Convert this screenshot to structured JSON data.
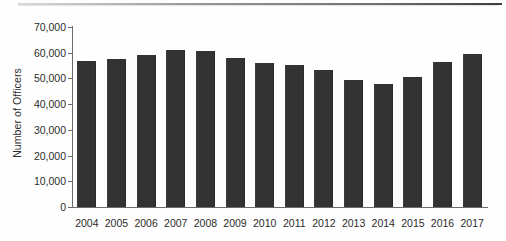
{
  "figure": {
    "background_color": "#fefefe",
    "bar_color": "#333333",
    "axis_color": "#6b6b6b",
    "text_color": "#2b2b2b",
    "top_rule": "horizontal-rule-artifact"
  },
  "axes": {
    "y_title": "Number of Officers",
    "y_tick_labels": [
      "70,000",
      "60,000",
      "50,000",
      "40,000",
      "30,000",
      "20,000",
      "10,000",
      "0"
    ],
    "y_tick_values": [
      70000,
      60000,
      50000,
      40000,
      30000,
      20000,
      10000,
      0
    ],
    "x_tick_labels": [
      "2004",
      "2005",
      "2006",
      "2007",
      "2008",
      "2009",
      "2010",
      "2011",
      "2012",
      "2013",
      "2014",
      "2015",
      "2016",
      "2017"
    ]
  },
  "chart_data": {
    "type": "bar",
    "title": "",
    "xlabel": "",
    "ylabel": "Number of Officers",
    "ylim": [
      0,
      70000
    ],
    "ytick_step": 10000,
    "grid": false,
    "legend": null,
    "categories": [
      "2004",
      "2005",
      "2006",
      "2007",
      "2008",
      "2009",
      "2010",
      "2011",
      "2012",
      "2013",
      "2014",
      "2015",
      "2016",
      "2017"
    ],
    "values": [
      56700,
      57700,
      59200,
      61000,
      60700,
      58100,
      56200,
      55300,
      53300,
      49300,
      47700,
      50700,
      56400,
      59500
    ],
    "series": [
      {
        "name": "Number of Officers",
        "color": "#333333",
        "values": [
          56700,
          57700,
          59200,
          61000,
          60700,
          58100,
          56200,
          55300,
          53300,
          49300,
          47700,
          50700,
          56400,
          59500
        ]
      }
    ]
  }
}
